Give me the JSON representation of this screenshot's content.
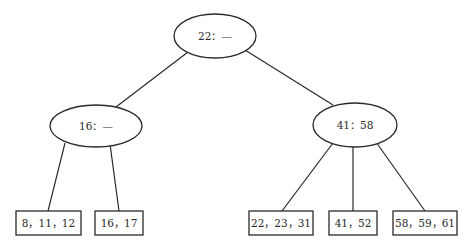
{
  "diagram": {
    "type": "b-tree",
    "stroke_color": "#2a2a2a",
    "background": "#ffffff",
    "internal_nodes": [
      {
        "id": "root",
        "label": "22：—",
        "cx": 215,
        "cy": 36,
        "rx": 41,
        "ry": 22
      },
      {
        "id": "left",
        "label": "16：—",
        "cx": 96,
        "cy": 126,
        "rx": 46,
        "ry": 21
      },
      {
        "id": "right",
        "label": "41：58",
        "cx": 355,
        "cy": 125,
        "rx": 42,
        "ry": 22
      }
    ],
    "leaf_nodes": [
      {
        "id": "leaf1",
        "label": "8，11，12",
        "x": 16,
        "y": 211,
        "w": 65,
        "h": 24
      },
      {
        "id": "leaf2",
        "label": "16，17",
        "x": 95,
        "y": 211,
        "w": 48,
        "h": 24
      },
      {
        "id": "leaf3",
        "label": "22，23，31",
        "x": 249,
        "y": 211,
        "w": 64,
        "h": 24
      },
      {
        "id": "leaf4",
        "label": "41，52",
        "x": 329,
        "y": 211,
        "w": 48,
        "h": 24
      },
      {
        "id": "leaf5",
        "label": "58，59，61",
        "x": 393,
        "y": 211,
        "w": 64,
        "h": 24
      }
    ],
    "edges": [
      {
        "from": "root",
        "to": "left",
        "x1": 188,
        "y1": 52,
        "x2": 116,
        "y2": 107
      },
      {
        "from": "root",
        "to": "right",
        "x1": 245,
        "y1": 50,
        "x2": 333,
        "y2": 105
      },
      {
        "from": "left",
        "to": "leaf1",
        "x1": 65,
        "y1": 143,
        "x2": 48,
        "y2": 211
      },
      {
        "from": "left",
        "to": "leaf2",
        "x1": 110,
        "y1": 144,
        "x2": 119,
        "y2": 211
      },
      {
        "from": "right",
        "to": "leaf3",
        "x1": 333,
        "y1": 143,
        "x2": 282,
        "y2": 211
      },
      {
        "from": "right",
        "to": "leaf4",
        "x1": 353,
        "y1": 147,
        "x2": 353,
        "y2": 211
      },
      {
        "from": "right",
        "to": "leaf5",
        "x1": 376,
        "y1": 142,
        "x2": 425,
        "y2": 211
      }
    ]
  }
}
